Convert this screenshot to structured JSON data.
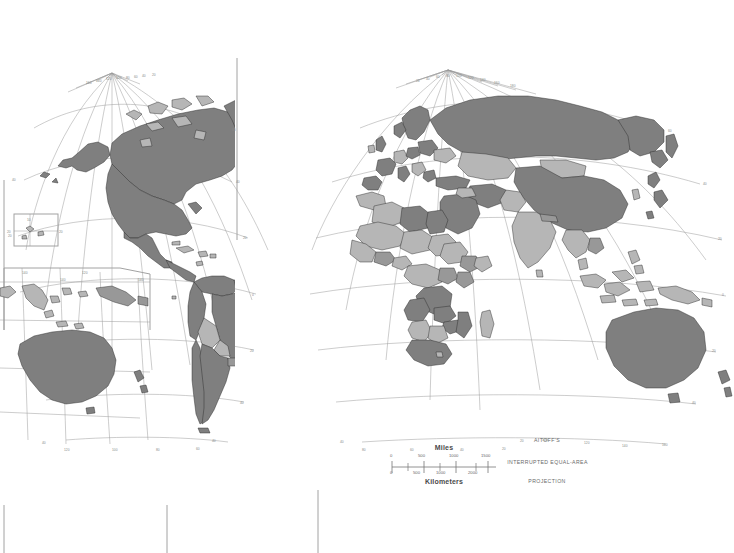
{
  "map": {
    "title": "World political map",
    "projection": {
      "line1": "AITOFF'S",
      "line2": "INTERRUPTED  EQUAL-AREA",
      "line3": "PROJECTION"
    },
    "scale": {
      "miles_label": "Miles",
      "kilometers_label": "Kilometers",
      "miles_ticks": [
        "0",
        "500",
        "1000",
        "1500"
      ],
      "km_ticks": [
        "0",
        "500",
        "1000",
        "2000"
      ]
    },
    "colors": {
      "background": "#ffffff",
      "land_dark": "#7f7f7f",
      "land_light": "#b6b6b6",
      "border": "#2b2b2b",
      "graticule": "#8d8d8d",
      "frame": "#9a9a9a",
      "label": "#7b7b7b"
    },
    "panels": [
      {
        "name": "western-hemisphere",
        "lobe": "Americas"
      },
      {
        "name": "eastern-hemisphere",
        "lobe": "Afro-Eurasia and Oceania"
      }
    ],
    "insets": [
      {
        "name": "mid-pacific-inset",
        "labels": [
          "10",
          "20",
          "20"
        ]
      },
      {
        "name": "oceania-inset",
        "labels": [
          "140",
          "120",
          "140"
        ]
      }
    ],
    "graticule": {
      "left_pole_longitudes": [
        "160",
        "140",
        "120",
        "100",
        "80",
        "60",
        "40",
        "20"
      ],
      "right_pole_longitudes": [
        "20",
        "40",
        "60",
        "80",
        "100",
        "120",
        "140",
        "160",
        "180"
      ],
      "left_bottom_longitudes": [
        "120",
        "100",
        "80",
        "60"
      ],
      "right_bottom_longitudes": [
        "80",
        "60",
        "40",
        "20"
      ],
      "left_latitudes": [
        "60",
        "40",
        "20",
        "0",
        "20",
        "40",
        "60"
      ],
      "right_latitudes": [
        "60",
        "40",
        "20",
        "0",
        "20",
        "40"
      ],
      "equator_label": "0"
    }
  }
}
